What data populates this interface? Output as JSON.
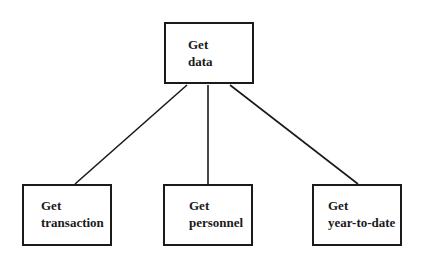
{
  "diagram": {
    "type": "hierarchy",
    "root": {
      "line1": "Get",
      "line2": "data"
    },
    "children": [
      {
        "line1": "Get",
        "line2": "transaction"
      },
      {
        "line1": "Get",
        "line2": "personnel"
      },
      {
        "line1": "Get",
        "line2": "year-to-date"
      }
    ],
    "edges": [
      {
        "from": "data",
        "to": "transaction"
      },
      {
        "from": "data",
        "to": "personnel"
      },
      {
        "from": "data",
        "to": "year-to-date"
      }
    ]
  }
}
